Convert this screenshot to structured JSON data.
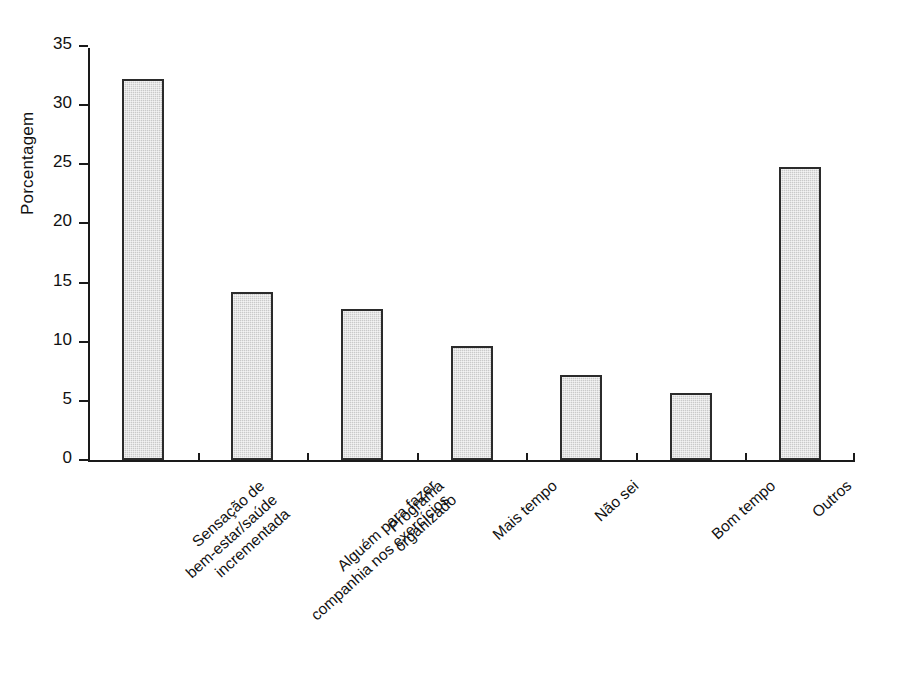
{
  "chart_data": {
    "type": "bar",
    "title": "",
    "xlabel": "",
    "ylabel": "Porcentagem",
    "ylim": [
      0,
      35
    ],
    "yticks": [
      0,
      5,
      10,
      15,
      20,
      25,
      30,
      35
    ],
    "grid": false,
    "legend": null,
    "categories": [
      "Sensação de bem-estar/saúde incrementada",
      "Alguém para fazer companhia nos exercícios",
      "Programa organizado",
      "Mais tempo",
      "Não sei",
      "Bom tempo",
      "Outros"
    ],
    "category_lines": [
      [
        "Sensação de",
        "bem-estar/saúde",
        "incrementada"
      ],
      [
        "Alguém para fazer",
        "companhia nos exercícios"
      ],
      [
        "Programa",
        "organizado"
      ],
      [
        "Mais tempo"
      ],
      [
        "Não sei"
      ],
      [
        "Bom tempo"
      ],
      [
        "Outros"
      ]
    ],
    "values": [
      32.2,
      14.2,
      12.8,
      9.6,
      7.2,
      5.7,
      24.8
    ],
    "bar_fill_color": "#c9c9c9",
    "bar_edge_color": "#2b2b2b",
    "axis_color": "#1a1a1a",
    "background_color": "#ffffff"
  },
  "axis": {
    "y_tick_labels": [
      "0",
      "5",
      "10",
      "15",
      "20",
      "25",
      "30",
      "35"
    ],
    "y_label": "Porcentagem"
  }
}
